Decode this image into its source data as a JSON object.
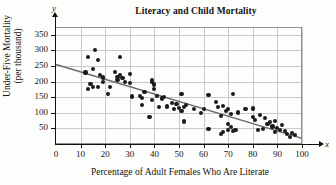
{
  "chart_data": {
    "type": "scatter",
    "title": "Literacy and Child Mortality",
    "xlabel": "Percentage of Adult Females Who Are Literate",
    "ylabel": "Under-Five Mortality (per thousand)",
    "ylabel_line1": "Under-Five Mortality",
    "ylabel_line2": "(per thousand)",
    "x_axis_symbol": "x",
    "y_axis_symbol": "y",
    "xlim": [
      0,
      100
    ],
    "ylim": [
      0,
      375
    ],
    "xticks": [
      0,
      10,
      20,
      30,
      40,
      50,
      60,
      70,
      80,
      90,
      100
    ],
    "yticks": [
      50,
      100,
      150,
      200,
      250,
      300,
      350
    ],
    "grid": true,
    "legend": null,
    "point_color": "#1a1a1a",
    "line_color": "#6b6b6b",
    "grid_color": "#c9c9c9",
    "axis_color": "#111111",
    "trend_line": {
      "x_start": 0,
      "y_start": 255,
      "x_end": 100,
      "y_end": 18
    },
    "points": [
      [
        13,
        280
      ],
      [
        13,
        176
      ],
      [
        14,
        192
      ],
      [
        15,
        241
      ],
      [
        15,
        182
      ],
      [
        16,
        302
      ],
      [
        17,
        269
      ],
      [
        17,
        182
      ],
      [
        12,
        229
      ],
      [
        18,
        221
      ],
      [
        19,
        213
      ],
      [
        19,
        199
      ],
      [
        21,
        161
      ],
      [
        22,
        183
      ],
      [
        24,
        231
      ],
      [
        25,
        215
      ],
      [
        25,
        205
      ],
      [
        26,
        278
      ],
      [
        26,
        220
      ],
      [
        27,
        211
      ],
      [
        28,
        198
      ],
      [
        30,
        224
      ],
      [
        30,
        196
      ],
      [
        31,
        152
      ],
      [
        34,
        155
      ],
      [
        35,
        148
      ],
      [
        35,
        125
      ],
      [
        36,
        166
      ],
      [
        38,
        86
      ],
      [
        39,
        205
      ],
      [
        39,
        198
      ],
      [
        39,
        141
      ],
      [
        40,
        191
      ],
      [
        40,
        176
      ],
      [
        41,
        154
      ],
      [
        42,
        118
      ],
      [
        43,
        146
      ],
      [
        44,
        151
      ],
      [
        45,
        120
      ],
      [
        47,
        132
      ],
      [
        48,
        112
      ],
      [
        49,
        128
      ],
      [
        50,
        115
      ],
      [
        51,
        161
      ],
      [
        51,
        107
      ],
      [
        52,
        119
      ],
      [
        52,
        72
      ],
      [
        53,
        124
      ],
      [
        56,
        112
      ],
      [
        59,
        99
      ],
      [
        60,
        113
      ],
      [
        62,
        156
      ],
      [
        62,
        49
      ],
      [
        65,
        134
      ],
      [
        66,
        118
      ],
      [
        67,
        89
      ],
      [
        67,
        31
      ],
      [
        68,
        38
      ],
      [
        68,
        122
      ],
      [
        69,
        105
      ],
      [
        70,
        112
      ],
      [
        70,
        63
      ],
      [
        70,
        44
      ],
      [
        71,
        97
      ],
      [
        71,
        55
      ],
      [
        72,
        42
      ],
      [
        72,
        161
      ],
      [
        73,
        46
      ],
      [
        74,
        101
      ],
      [
        77,
        112
      ],
      [
        80,
        114
      ],
      [
        80,
        86
      ],
      [
        81,
        78
      ],
      [
        82,
        44
      ],
      [
        83,
        92
      ],
      [
        84,
        47
      ],
      [
        85,
        83
      ],
      [
        86,
        63
      ],
      [
        87,
        71
      ],
      [
        88,
        56
      ],
      [
        89,
        38
      ],
      [
        89,
        74
      ],
      [
        90,
        52
      ],
      [
        91,
        44
      ],
      [
        92,
        60
      ],
      [
        93,
        41
      ],
      [
        94,
        33
      ],
      [
        95,
        23
      ],
      [
        96,
        36
      ],
      [
        97,
        30
      ]
    ]
  }
}
